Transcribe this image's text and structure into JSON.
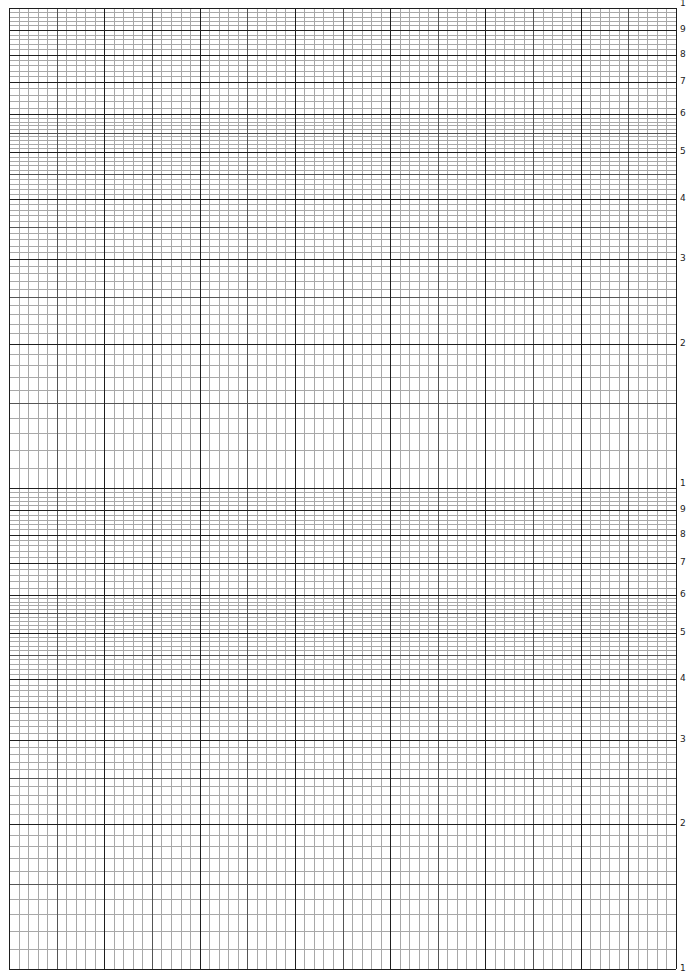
{
  "paper": {
    "type": "semi-log graph paper",
    "cycles": 2,
    "x_divisions": {
      "major": 7,
      "minor_per_major": 10
    },
    "y_scale": "logarithmic",
    "colors": {
      "major_line": "#1e1e1e",
      "medium_line": "#555555",
      "minor_line": "#a8a8a8",
      "background": "#ffffff"
    }
  },
  "frame": {
    "left": 9,
    "right": 676,
    "top": 8,
    "bottom": 969,
    "cycle_boundary": 488
  },
  "y_labels": {
    "upper_cycle": [
      "1",
      "9",
      "8",
      "7",
      "6",
      "5",
      "4",
      "3",
      "2"
    ],
    "lower_cycle": [
      "1",
      "9",
      "8",
      "7",
      "6",
      "5",
      "4",
      "3",
      "2",
      "1"
    ]
  }
}
